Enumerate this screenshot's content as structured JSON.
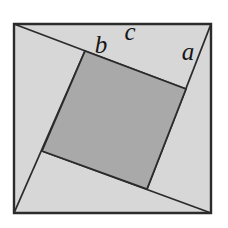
{
  "diagram": {
    "labels": {
      "a": {
        "text": "a",
        "x": 188,
        "y": 60
      },
      "b": {
        "text": "b",
        "x": 101,
        "y": 53
      },
      "c": {
        "text": "c",
        "x": 130,
        "y": 40
      }
    }
  },
  "colors": {
    "background": "#ffffff",
    "triangle_fill": "#d7d7d7",
    "inner_square_fill": "#a9a9a9",
    "line": "#2b2b2b"
  },
  "geometry": {
    "outer_square_points": "14,24 211,24 211,213 14,213",
    "inner_square_points": "85,51 186,89 147,189 42,151",
    "pinwheel_lines": {
      "top": {
        "x1": 14,
        "y1": 24,
        "x2": 186,
        "y2": 89
      },
      "right": {
        "x1": 211,
        "y1": 24,
        "x2": 147,
        "y2": 189
      },
      "bottom": {
        "x1": 211,
        "y1": 213,
        "x2": 42,
        "y2": 151
      },
      "left": {
        "x1": 14,
        "y1": 213,
        "x2": 85,
        "y2": 51
      }
    }
  }
}
